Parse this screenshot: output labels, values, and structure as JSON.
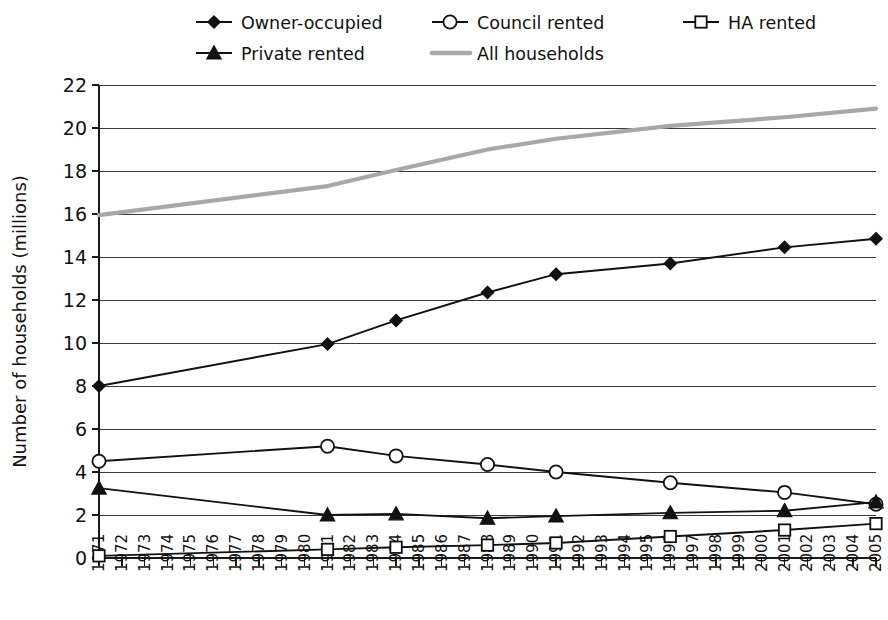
{
  "chart_data": {
    "type": "line",
    "title": "",
    "xlabel": "",
    "ylabel": "Number of households (millions)",
    "ylim": [
      0,
      22
    ],
    "ytick_step": 2,
    "yticks": [
      "0",
      "2",
      "4",
      "6",
      "8",
      "10",
      "12",
      "14",
      "16",
      "18",
      "20",
      "22"
    ],
    "grid": true,
    "legend_position": "top",
    "categories": [
      "1971",
      "1972",
      "1973",
      "1974",
      "1975",
      "1976",
      "1977",
      "1978",
      "1979",
      "1980",
      "1981",
      "1982",
      "1983",
      "1984",
      "1985",
      "1986",
      "1987",
      "1988",
      "1989",
      "1990",
      "1991",
      "1992",
      "1993",
      "1994",
      "1995",
      "1996",
      "1997",
      "1998",
      "1999",
      "2000",
      "2001",
      "2002",
      "2003",
      "2004",
      "2005"
    ],
    "marker_years": [
      "1971",
      "1981",
      "1984",
      "1988",
      "1991",
      "1996",
      "2001",
      "2005"
    ],
    "series": [
      {
        "name": "Owner-occupied",
        "marker": "diamond",
        "marker_fill": "filled",
        "color": "#111111",
        "x": [
          "1971",
          "1981",
          "1984",
          "1988",
          "1991",
          "1996",
          "2001",
          "2005"
        ],
        "values": [
          8.0,
          9.95,
          11.05,
          12.35,
          13.2,
          13.7,
          14.45,
          14.85
        ]
      },
      {
        "name": "Council rented",
        "marker": "circle",
        "marker_fill": "open",
        "color": "#111111",
        "x": [
          "1971",
          "1981",
          "1984",
          "1988",
          "1991",
          "1996",
          "2001",
          "2005"
        ],
        "values": [
          4.5,
          5.2,
          4.75,
          4.35,
          4.0,
          3.5,
          3.05,
          2.5
        ]
      },
      {
        "name": "HA rented",
        "marker": "square",
        "marker_fill": "open",
        "color": "#111111",
        "x": [
          "1971",
          "1981",
          "1984",
          "1988",
          "1991",
          "1996",
          "2001",
          "2005"
        ],
        "values": [
          0.1,
          0.4,
          0.5,
          0.6,
          0.7,
          1.0,
          1.3,
          1.6
        ]
      },
      {
        "name": "Private rented",
        "marker": "triangle",
        "marker_fill": "filled",
        "color": "#111111",
        "x": [
          "1971",
          "1981",
          "1984",
          "1988",
          "1991",
          "1996",
          "2001",
          "2005"
        ],
        "values": [
          3.25,
          2.0,
          2.05,
          1.85,
          1.95,
          2.1,
          2.2,
          2.6
        ]
      },
      {
        "name": "All households",
        "marker": "none",
        "marker_fill": "none",
        "color": "#a8a8a8",
        "x": [
          "1971",
          "1981",
          "1984",
          "1988",
          "1991",
          "1996",
          "2001",
          "2005"
        ],
        "values": [
          15.95,
          17.3,
          18.05,
          19.0,
          19.5,
          20.1,
          20.5,
          20.9
        ]
      }
    ],
    "legend_entries": [
      {
        "label": "Owner-occupied",
        "marker": "diamond",
        "marker_fill": "filled",
        "color": "#111111",
        "row": 0,
        "col": 0
      },
      {
        "label": "Council rented",
        "marker": "circle",
        "marker_fill": "open",
        "color": "#111111",
        "row": 0,
        "col": 1
      },
      {
        "label": "HA rented",
        "marker": "square",
        "marker_fill": "open",
        "color": "#111111",
        "row": 0,
        "col": 2
      },
      {
        "label": "Private rented",
        "marker": "triangle",
        "marker_fill": "filled",
        "color": "#111111",
        "row": 1,
        "col": 0
      },
      {
        "label": "All households",
        "marker": "none",
        "marker_fill": "none",
        "color": "#a8a8a8",
        "row": 1,
        "col": 1
      }
    ]
  }
}
